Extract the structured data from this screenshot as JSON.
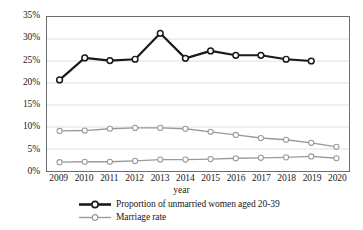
{
  "chart_data": {
    "type": "line",
    "title": "",
    "xlabel": "year",
    "ylabel": "",
    "categories": [
      "2009",
      "2010",
      "2011",
      "2012",
      "2013",
      "2014",
      "2015",
      "2016",
      "2017",
      "2018",
      "2019",
      "2020"
    ],
    "ylim": [
      0,
      35
    ],
    "ytick_labels": [
      "0%",
      "5%",
      "10%",
      "15%",
      "20%",
      "25%",
      "30%",
      "35%"
    ],
    "ytick_values": [
      0,
      5,
      10,
      15,
      20,
      25,
      30,
      35
    ],
    "grid": true,
    "grid_axis": "y",
    "legend_position": "bottom",
    "series": [
      {
        "name": "Proportion of unmarried women aged 20-39",
        "color": "#1a1a1a",
        "line_width": 2.2,
        "marker": "circle",
        "values": [
          20.7,
          25.7,
          25.1,
          25.4,
          31.3,
          25.6,
          27.3,
          26.3,
          26.3,
          25.4,
          25.0,
          null
        ]
      },
      {
        "name": "Marriage rate",
        "color": "#9a9a9a",
        "line_width": 1.3,
        "marker": "circle",
        "values": [
          9.1,
          9.2,
          9.6,
          9.8,
          9.8,
          9.6,
          8.9,
          8.2,
          7.5,
          7.1,
          6.4,
          5.5
        ]
      },
      {
        "name": "",
        "color": "#9a9a9a",
        "line_width": 1.3,
        "marker": "circle",
        "values": [
          2.0,
          2.1,
          2.1,
          2.3,
          2.6,
          2.6,
          2.7,
          2.9,
          3.0,
          3.1,
          3.3,
          2.9
        ]
      }
    ],
    "legend_entries": [
      {
        "label": "Proportion of unmarried women aged 20-39",
        "color": "#1a1a1a",
        "line_width": 2.6
      },
      {
        "label": "Marriage rate",
        "color": "#9a9a9a",
        "line_width": 1.4
      }
    ]
  }
}
